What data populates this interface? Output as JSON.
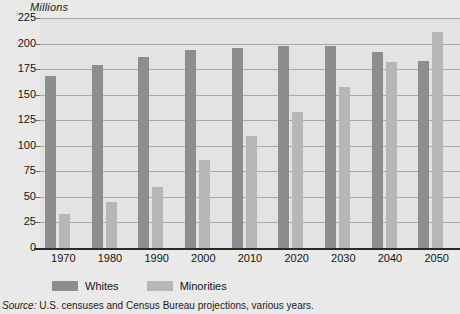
{
  "chart_data": {
    "type": "bar",
    "title": "",
    "subtitle": "",
    "xlabel": "",
    "ylabel": "Millions",
    "ylim": [
      0,
      225
    ],
    "ytick_step": 25,
    "yticks": [
      225,
      200,
      175,
      150,
      125,
      100,
      75,
      50,
      25,
      0
    ],
    "grid": true,
    "legend_position": "bottom-left",
    "categories": [
      "1970",
      "1980",
      "1990",
      "2000",
      "2010",
      "2020",
      "2030",
      "2040",
      "2050"
    ],
    "series": [
      {
        "name": "Whites",
        "color": "#8d8d8b",
        "values": [
          170,
          181,
          189,
          196,
          198,
          200,
          200,
          194,
          185
        ]
      },
      {
        "name": "Minorities",
        "color": "#b6b6b4",
        "values": [
          35,
          47,
          62,
          88,
          112,
          135,
          159,
          184,
          213
        ]
      }
    ],
    "source_lead": "Source:",
    "source_text": "U.S. censuses and Census Bureau projections, various years."
  },
  "colors": {
    "figure_background": "#e9e9e7",
    "plot_background": "#e3e3e1",
    "gridline": "#a9a9a7",
    "axis_line": "#2a2a2a",
    "text": "#141414"
  }
}
